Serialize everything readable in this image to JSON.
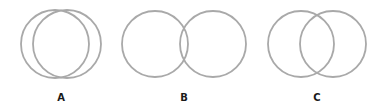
{
  "diagram": {
    "stroke_color": "#a9a9a9",
    "background": "#ffffff",
    "sets": [
      {
        "label": "A",
        "relationship": "large overlap",
        "circles": [
          {
            "cx": 55,
            "cy": 44,
            "r": 34
          },
          {
            "cx": 67,
            "cy": 44,
            "r": 34
          }
        ],
        "label_x": 61
      },
      {
        "label": "B",
        "relationship": "small overlap",
        "circles": [
          {
            "cx": 155,
            "cy": 44,
            "r": 33
          },
          {
            "cx": 213,
            "cy": 44,
            "r": 33
          }
        ],
        "label_x": 184
      },
      {
        "label": "C",
        "relationship": "medium overlap",
        "circles": [
          {
            "cx": 301,
            "cy": 44,
            "r": 33
          },
          {
            "cx": 333,
            "cy": 44,
            "r": 33
          }
        ],
        "label_x": 317
      }
    ]
  }
}
